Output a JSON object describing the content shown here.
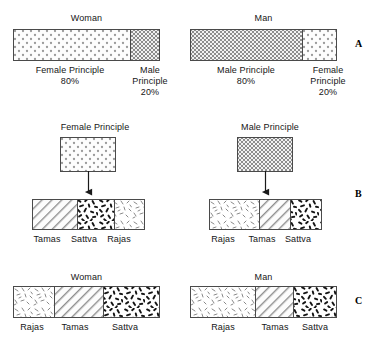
{
  "figure": {
    "sections": [
      {
        "letter": "A",
        "panels": [
          {
            "title": "Woman",
            "segments": [
              {
                "label": "Female Principle",
                "value": "80%",
                "pattern": "dots",
                "percent": 80
              },
              {
                "label": "Male\nPrinciple",
                "value": "20%",
                "pattern": "checker",
                "percent": 20
              }
            ]
          },
          {
            "title": "Man",
            "segments": [
              {
                "label": "Male Principle",
                "value": "80%",
                "pattern": "checker",
                "percent": 80
              },
              {
                "label": "Female\nPrinciple",
                "value": "20%",
                "pattern": "dots",
                "percent": 20
              }
            ]
          }
        ]
      },
      {
        "letter": "B",
        "panels": [
          {
            "title": "Female Principle",
            "source_pattern": "dots",
            "segments": [
              {
                "label": "Tamas",
                "pattern": "hatch",
                "percent": 40
              },
              {
                "label": "Sattva",
                "pattern": "dense",
                "percent": 33
              },
              {
                "label": "Rajas",
                "pattern": "sparse",
                "percent": 27
              }
            ]
          },
          {
            "title": "Male Principle",
            "source_pattern": "checker",
            "segments": [
              {
                "label": "Rajas",
                "pattern": "sparse",
                "percent": 44
              },
              {
                "label": "Tamas",
                "pattern": "hatch",
                "percent": 27
              },
              {
                "label": "Sattva",
                "pattern": "dense",
                "percent": 29
              }
            ]
          }
        ]
      },
      {
        "letter": "C",
        "panels": [
          {
            "title": "Woman",
            "segments": [
              {
                "label": "Rajas",
                "pattern": "sparse",
                "percent": 28
              },
              {
                "label": "Tamas",
                "pattern": "hatch",
                "percent": 33
              },
              {
                "label": "Sattva",
                "pattern": "dense",
                "percent": 39
              }
            ]
          },
          {
            "title": "Man",
            "segments": [
              {
                "label": "Rajas",
                "pattern": "sparse",
                "percent": 44
              },
              {
                "label": "Tamas",
                "pattern": "hatch",
                "percent": 26
              },
              {
                "label": "Sattva",
                "pattern": "dense",
                "percent": 30
              }
            ]
          }
        ]
      }
    ],
    "labels": {
      "woman": "Woman",
      "man": "Man",
      "female_principle": "Female Principle",
      "male_principle": "Male Principle",
      "female_principle_wrapped": "Female\nPrinciple",
      "male_principle_wrapped": "Male\nPrinciple",
      "pct80": "80%",
      "pct20": "20%",
      "tamas": "Tamas",
      "sattva": "Sattva",
      "rajas": "Rajas",
      "letter_a": "A",
      "letter_b": "B",
      "letter_c": "C"
    },
    "colors": {
      "ink": "#161616",
      "stroke": "#4a4a4a",
      "background": "#ffffff"
    }
  }
}
